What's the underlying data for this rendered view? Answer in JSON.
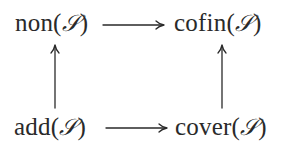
{
  "diagram": {
    "type": "commutative-diagram",
    "nodes": {
      "top_left": {
        "name": "non",
        "arg": "S",
        "position": "top-left"
      },
      "top_right": {
        "name": "cofin",
        "arg": "S",
        "position": "top-right"
      },
      "bottom_left": {
        "name": "add",
        "arg": "S",
        "position": "bottom-left"
      },
      "bottom_right": {
        "name": "cover",
        "arg": "S",
        "position": "bottom-right"
      }
    },
    "edges": [
      {
        "from": "non",
        "to": "cofin",
        "direction": "right"
      },
      {
        "from": "add",
        "to": "cover",
        "direction": "right"
      },
      {
        "from": "add",
        "to": "non",
        "direction": "up"
      },
      {
        "from": "cover",
        "to": "cofin",
        "direction": "up"
      }
    ],
    "symbols": {
      "open_paren": "(",
      "close_paren": ")",
      "ideal": "𝒮"
    },
    "colors": {
      "ink": "#2a2a2a",
      "background": "#ffffff"
    }
  }
}
